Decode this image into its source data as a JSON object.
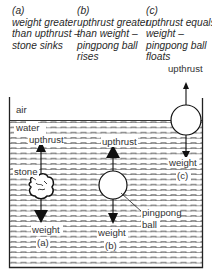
{
  "captions": [
    {
      "id": "a",
      "tag": "(a)",
      "lines": [
        "weight greater",
        "than upthrust –",
        "stone sinks"
      ]
    },
    {
      "id": "b",
      "tag": "(b)",
      "lines": [
        "upthrust greater",
        "than weight –",
        "pingpong ball",
        "rises"
      ]
    },
    {
      "id": "c",
      "tag": "(c)",
      "lines": [
        "upthrust equals",
        "weight –",
        "pingpong ball",
        "floats"
      ]
    }
  ],
  "labels": {
    "air": "air",
    "water": "water",
    "stone": "stone",
    "upthrust_a": "upthrust",
    "upthrust_b": "upthrust",
    "upthrust_c": "upthrust",
    "weight_a": "weight",
    "weight_b": "weight",
    "weight_c": "weight",
    "tag_a": "(a)",
    "tag_b": "(b)",
    "tag_c": "(c)",
    "pingpong": "pingpong",
    "ball": "ball"
  },
  "colors": {
    "line": "#222222",
    "dash": "#555555",
    "background": "#ffffff"
  }
}
